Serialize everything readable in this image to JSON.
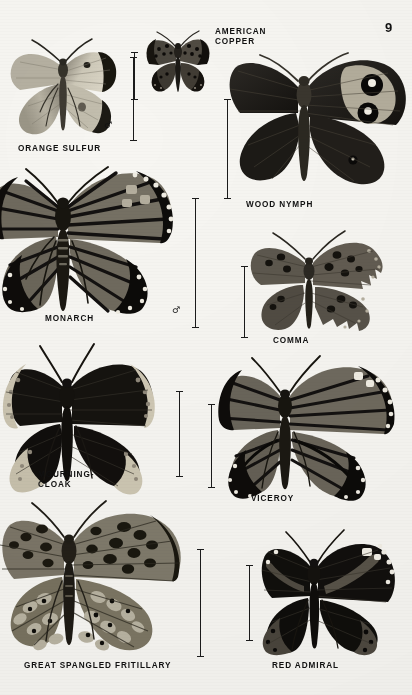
{
  "page": {
    "number": "9",
    "width": 412,
    "height": 695,
    "background": "#f7f6f2",
    "ink": "#111111"
  },
  "plate": {
    "kind": "field-guide-plate",
    "subject": "butterflies",
    "specimen_count": 9,
    "scale_bar_count": 9,
    "sex_symbols": [
      "♂",
      "♂"
    ]
  },
  "specimens": [
    {
      "id": "orange-sulfur",
      "label": "ORANGE SULFUR",
      "label_lines": [
        "ORANGE SULFUR"
      ],
      "label_x": 18,
      "label_y": 145,
      "sex": "♂",
      "sex_x": 104,
      "sex_y": 126,
      "body": {
        "x": 6,
        "y": 22,
        "w": 114,
        "h": 124
      },
      "colors": {
        "wing": "#c9c4b4",
        "tip": "#1d1b17",
        "body": "#3a372f",
        "spot": "#24221c"
      },
      "scale_bar": {
        "x": 133,
        "y": 57,
        "h": 84
      }
    },
    {
      "id": "american-copper",
      "label": "AMERICAN\nCOPPER",
      "label_lines": [
        "AMERICAN",
        "COPPER"
      ],
      "label_x": 215,
      "label_y": 28,
      "sex": "",
      "body": {
        "x": 143,
        "y": 27,
        "w": 70,
        "h": 70
      },
      "colors": {
        "wing": "#4b4741",
        "dark": "#191714",
        "body": "#201e1a",
        "spot": "#0d0c0a"
      },
      "scale_bar": {
        "x": 134,
        "y": 52,
        "h": 48
      }
    },
    {
      "id": "wood-nymph",
      "label": "WOOD NYMPH",
      "label_lines": [
        "WOOD NYMPH"
      ],
      "label_x": 246,
      "label_y": 204,
      "sex": "",
      "body": {
        "x": 228,
        "y": 33,
        "w": 184,
        "h": 166
      },
      "colors": {
        "wing": "#211f1b",
        "band": "#b9b3a2",
        "eye": "#090807",
        "pupil": "#f1eee5",
        "body": "#2c2924"
      },
      "scale_bar": {
        "x": 227,
        "y": 99,
        "h": 100
      }
    },
    {
      "id": "monarch",
      "label": "MONARCH",
      "label_lines": [
        "MONARCH"
      ],
      "label_x": 45,
      "label_y": 318,
      "sex": "♂",
      "sex_x": 174,
      "sex_y": 309,
      "body": {
        "x": 0,
        "y": 155,
        "w": 190,
        "h": 168
      },
      "colors": {
        "wing": "#6f6a5e",
        "vein": "#141210",
        "margin": "#0d0c0a",
        "spot": "#efece2",
        "body": "#17150f"
      },
      "scale_bar": {
        "x": 194,
        "y": 198,
        "h": 130
      }
    },
    {
      "id": "comma",
      "label": "COMMA",
      "label_lines": [
        "COMMA"
      ],
      "label_x": 273,
      "label_y": 340,
      "sex": "",
      "body": {
        "x": 245,
        "y": 229,
        "w": 152,
        "h": 110
      },
      "colors": {
        "wing": "#5d584e",
        "dark": "#16140f",
        "spot": "#100e0b",
        "edge": "#b6b0a0",
        "body": "#23201a"
      },
      "scale_bar": {
        "x": 244,
        "y": 266,
        "h": 72
      }
    },
    {
      "id": "mourning-cloak",
      "label": "MOURNING-\nCLOAK",
      "label_lines": [
        "MOURNING-",
        "CLOAK"
      ],
      "label_x": 38,
      "label_y": 480,
      "sex": "",
      "body": {
        "x": 6,
        "y": 342,
        "w": 168,
        "h": 146
      },
      "colors": {
        "wing": "#14120f",
        "border": "#cfc8b4",
        "dot": "#9a9383",
        "body": "#0d0c0a"
      },
      "scale_bar": {
        "x": 178,
        "y": 391,
        "h": 86
      }
    },
    {
      "id": "viceroy",
      "label": "VICEROY",
      "label_lines": [
        "VICEROY"
      ],
      "label_x": 251,
      "label_y": 498,
      "sex": "",
      "body": {
        "x": 222,
        "y": 352,
        "w": 190,
        "h": 142
      },
      "colors": {
        "wing": "#6a655a",
        "vein": "#131110",
        "margin": "#0c0b09",
        "spot": "#f0ede3",
        "body": "#17150f"
      },
      "scale_bar": {
        "x": 211,
        "y": 404,
        "h": 84
      }
    },
    {
      "id": "great-spangled-fritillary",
      "label": "GREAT SPANGLED FRITILLARY",
      "label_lines": [
        "GREAT SPANGLED FRITILLARY"
      ],
      "label_x": 24,
      "label_y": 665,
      "sex": "",
      "body": {
        "x": 2,
        "y": 497,
        "w": 196,
        "h": 158
      },
      "colors": {
        "wing": "#7b7567",
        "dark": "#19170f",
        "spot": "#0e0d0a",
        "pale": "#b9b3a2",
        "body": "#201e18"
      },
      "scale_bar": {
        "x": 199,
        "y": 549,
        "h": 108
      }
    },
    {
      "id": "red-admiral",
      "label": "RED ADMIRAL",
      "label_lines": [
        "RED ADMIRAL"
      ],
      "label_x": 272,
      "label_y": 665,
      "sex": "",
      "body": {
        "x": 258,
        "y": 528,
        "w": 148,
        "h": 126
      },
      "colors": {
        "wing": "#100f0c",
        "band": "#585348",
        "spot": "#f2efe6",
        "body": "#0b0a08"
      },
      "scale_bar": {
        "x": 248,
        "y": 565,
        "h": 76
      }
    }
  ]
}
